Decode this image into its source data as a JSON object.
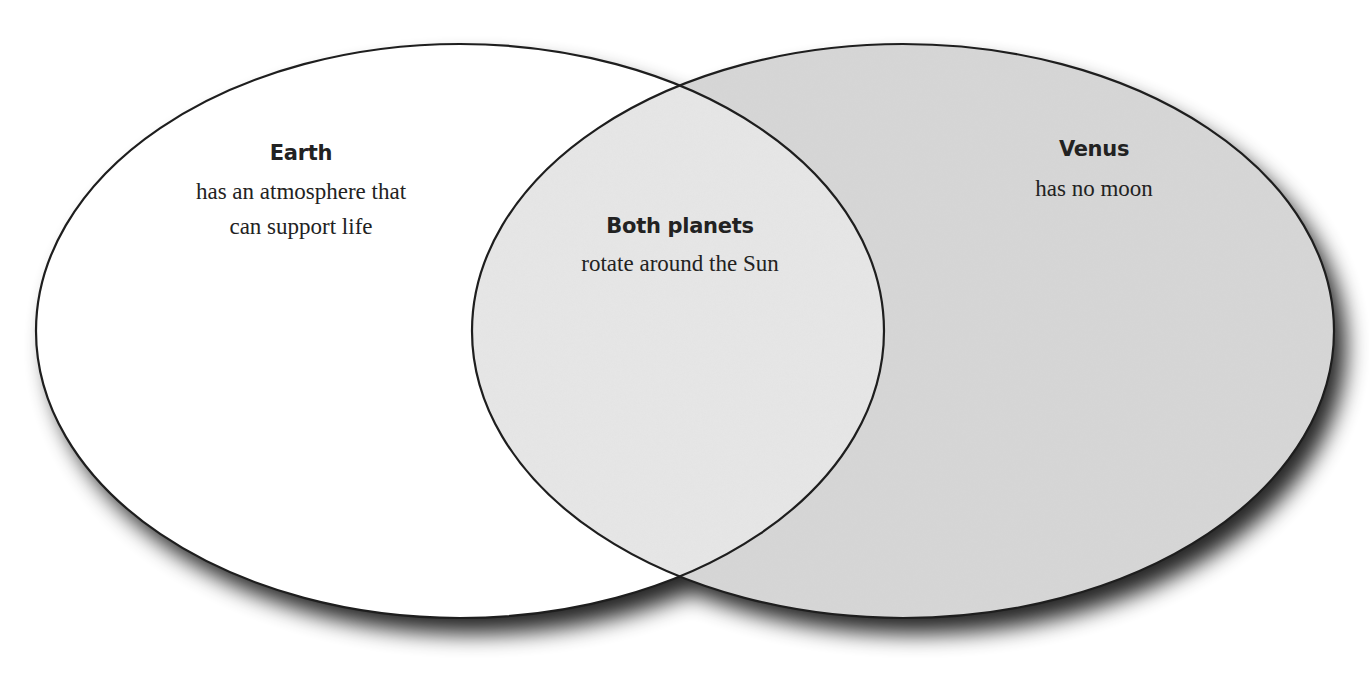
{
  "diagram": {
    "type": "venn",
    "colors": {
      "left_fill": "#ffffff",
      "right_fill": "#d6d6d6",
      "overlap_fill": "#e6e6e6",
      "outline": "#1e1e1e",
      "text": "#222222",
      "shadow": "#000000"
    },
    "left": {
      "title": "Earth",
      "lines": [
        "has an atmosphere that",
        "can support life"
      ]
    },
    "overlap": {
      "title": "Both planets",
      "lines": [
        "rotate around the Sun"
      ]
    },
    "right": {
      "title": "Venus",
      "lines": [
        "has no moon"
      ]
    }
  }
}
